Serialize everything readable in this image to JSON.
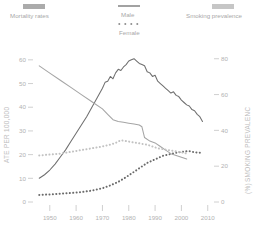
{
  "legend": {
    "groups": [
      {
        "name": "mortality-rates",
        "label": "Mortality rates",
        "swatch_color": "#8f8f8f",
        "swatch_type": "block"
      },
      {
        "name": "smoking-prevalence",
        "label": "Smoking prevalence",
        "swatch_color": "#b8b8b8",
        "swatch_type": "block"
      }
    ],
    "sex": [
      {
        "name": "male",
        "label": "Male",
        "style": "solid",
        "swatch_color": "#707070"
      },
      {
        "name": "female",
        "label": "Female",
        "style": "dotted",
        "swatch_color": "#707070"
      }
    ]
  },
  "axes": {
    "left": {
      "title": "ATE PER 100,000",
      "ticks": [
        "0",
        "10",
        "20",
        "30",
        "40",
        "50",
        "60"
      ],
      "min": 0,
      "max": 65
    },
    "right": {
      "title": "SMOKING PREVALENC",
      "title_unit": "(%)",
      "ticks": [
        "0",
        "20",
        "40",
        "60",
        "80"
      ],
      "min": 0,
      "max": 86
    },
    "bottom": {
      "ticks": [
        "1950",
        "1960",
        "1970",
        "1980",
        "1990",
        "2000",
        "2010"
      ],
      "min": 1944,
      "max": 2012
    }
  },
  "colors": {
    "male_mortality": "#6f6f6f",
    "female_mortality": "#6b6b6b",
    "male_prevalence": "#a5a5a5",
    "female_prevalence": "#c2c2c2",
    "axis": "#c4c4c4",
    "text": "#a8a8a8"
  },
  "chart_data": {
    "type": "line",
    "title": "",
    "subtitle": "",
    "xlabel": "",
    "ylabel": "ATE PER 100,000",
    "y2label": "SMOKING PREVALENC (%)",
    "xlim": [
      1944,
      2012
    ],
    "ylim": [
      0,
      65
    ],
    "y2lim": [
      0,
      86
    ],
    "grid": false,
    "legend_position": "top",
    "xticks": [
      1950,
      1960,
      1970,
      1980,
      1990,
      2000,
      2010
    ],
    "yticks": [
      0,
      10,
      20,
      30,
      40,
      50,
      60
    ],
    "y2ticks": [
      0,
      20,
      40,
      60,
      80
    ],
    "series": [
      {
        "name": "Male mortality rates",
        "sex": "male",
        "measure": "mortality",
        "axis": "left",
        "style": "solid",
        "color": "#6f6f6f",
        "units": "per 100,000",
        "x": [
          1946,
          1948,
          1950,
          1952,
          1954,
          1956,
          1958,
          1960,
          1962,
          1964,
          1966,
          1968,
          1970,
          1971,
          1972,
          1973,
          1974,
          1975,
          1976,
          1977,
          1978,
          1979,
          1980,
          1981,
          1982,
          1983,
          1984,
          1985,
          1986,
          1987,
          1988,
          1989,
          1990,
          1991,
          1992,
          1993,
          1994,
          1995,
          1996,
          1997,
          1998,
          1999,
          2000,
          2001,
          2002,
          2003,
          2004,
          2005,
          2006,
          2007,
          2008
        ],
        "y": [
          10,
          11.5,
          13.5,
          16,
          19,
          22,
          25.5,
          29,
          32.5,
          36,
          40,
          44,
          48,
          50.5,
          51,
          53,
          52,
          54.5,
          56,
          55.5,
          57,
          58,
          59.5,
          60,
          60.5,
          59.5,
          58.5,
          58,
          57.5,
          55,
          54.5,
          53,
          53.5,
          51,
          50,
          49,
          48,
          47,
          46,
          46.5,
          45,
          44.5,
          43,
          42,
          41,
          40.5,
          39,
          38.5,
          37,
          36,
          34
        ]
      },
      {
        "name": "Female mortality rates",
        "sex": "female",
        "measure": "mortality",
        "axis": "left",
        "style": "dotted",
        "color": "#6b6b6b",
        "units": "per 100,000",
        "x": [
          1946,
          1950,
          1954,
          1958,
          1962,
          1966,
          1970,
          1973,
          1976,
          1979,
          1981,
          1983,
          1985,
          1987,
          1989,
          1991,
          1993,
          1995,
          1997,
          1999,
          2001,
          2003,
          2005,
          2007,
          2008
        ],
        "y": [
          3,
          3.2,
          3.5,
          3.8,
          4.2,
          4.8,
          5.8,
          7,
          8.5,
          10.5,
          12,
          13.5,
          15,
          16.5,
          17.5,
          18.5,
          19.5,
          20,
          20.5,
          21,
          21.3,
          21.5,
          21,
          20.8,
          20.5
        ]
      },
      {
        "name": "Male smoking prevalence",
        "sex": "male",
        "measure": "prevalence",
        "axis": "right",
        "style": "solid",
        "color": "#a5a5a5",
        "units": "%",
        "x": [
          1946,
          1950,
          1954,
          1958,
          1962,
          1966,
          1970,
          1972,
          1974,
          1976,
          1978,
          1980,
          1982,
          1984,
          1985,
          1986,
          1988,
          1990,
          1992,
          1994,
          1996,
          1998,
          2000,
          2002
        ],
        "y": [
          76,
          72,
          68,
          64,
          60,
          56,
          52,
          49,
          46,
          45,
          44.5,
          44,
          43.5,
          43,
          42,
          36,
          34,
          33,
          31,
          29,
          27,
          26,
          25,
          24
        ]
      },
      {
        "name": "Female smoking prevalence",
        "sex": "female",
        "measure": "prevalence",
        "axis": "right",
        "style": "dotted",
        "color": "#c2c2c2",
        "units": "%",
        "x": [
          1946,
          1950,
          1954,
          1958,
          1962,
          1966,
          1970,
          1973,
          1975,
          1977,
          1979,
          1981,
          1983,
          1985,
          1987,
          1989,
          1991,
          1993,
          1995,
          1997,
          1999,
          2001,
          2002
        ],
        "y": [
          26,
          26.5,
          27,
          28,
          29,
          30,
          31,
          32,
          33,
          34.5,
          34,
          33.5,
          33,
          32.5,
          32,
          31,
          30,
          29.5,
          29,
          28.5,
          28,
          27.5,
          27
        ]
      }
    ]
  }
}
